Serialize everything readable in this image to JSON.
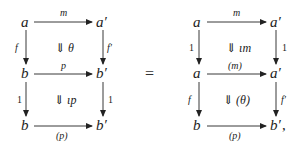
{
  "equation": {
    "equals_sign": "=",
    "trailing_punctuation": ","
  },
  "left_diagram": {
    "nodes": {
      "top_left": "a",
      "top_right": "a′",
      "mid_left": "b",
      "mid_right": "b′",
      "bot_left": "b",
      "bot_right": "b′"
    },
    "arrows": {
      "top": "m",
      "left_upper": "f",
      "right_upper": "f′",
      "middle": "p",
      "left_lower": "1",
      "right_lower": "1",
      "bottom": "(p)"
    },
    "cells": {
      "upper": "⇓ θ",
      "lower": "⇓ ιp"
    }
  },
  "right_diagram": {
    "nodes": {
      "top_left": "a",
      "top_right": "a′",
      "mid_left": "a",
      "mid_right": "a′",
      "bot_left": "b",
      "bot_right": "b′"
    },
    "arrows": {
      "top": "m",
      "left_upper": "1",
      "right_upper": "1",
      "middle": "(m)",
      "left_lower": "f",
      "right_lower": "f′",
      "bottom": "(p)"
    },
    "cells": {
      "upper": "⇓ ιm",
      "lower": "⇓ (θ)"
    }
  }
}
